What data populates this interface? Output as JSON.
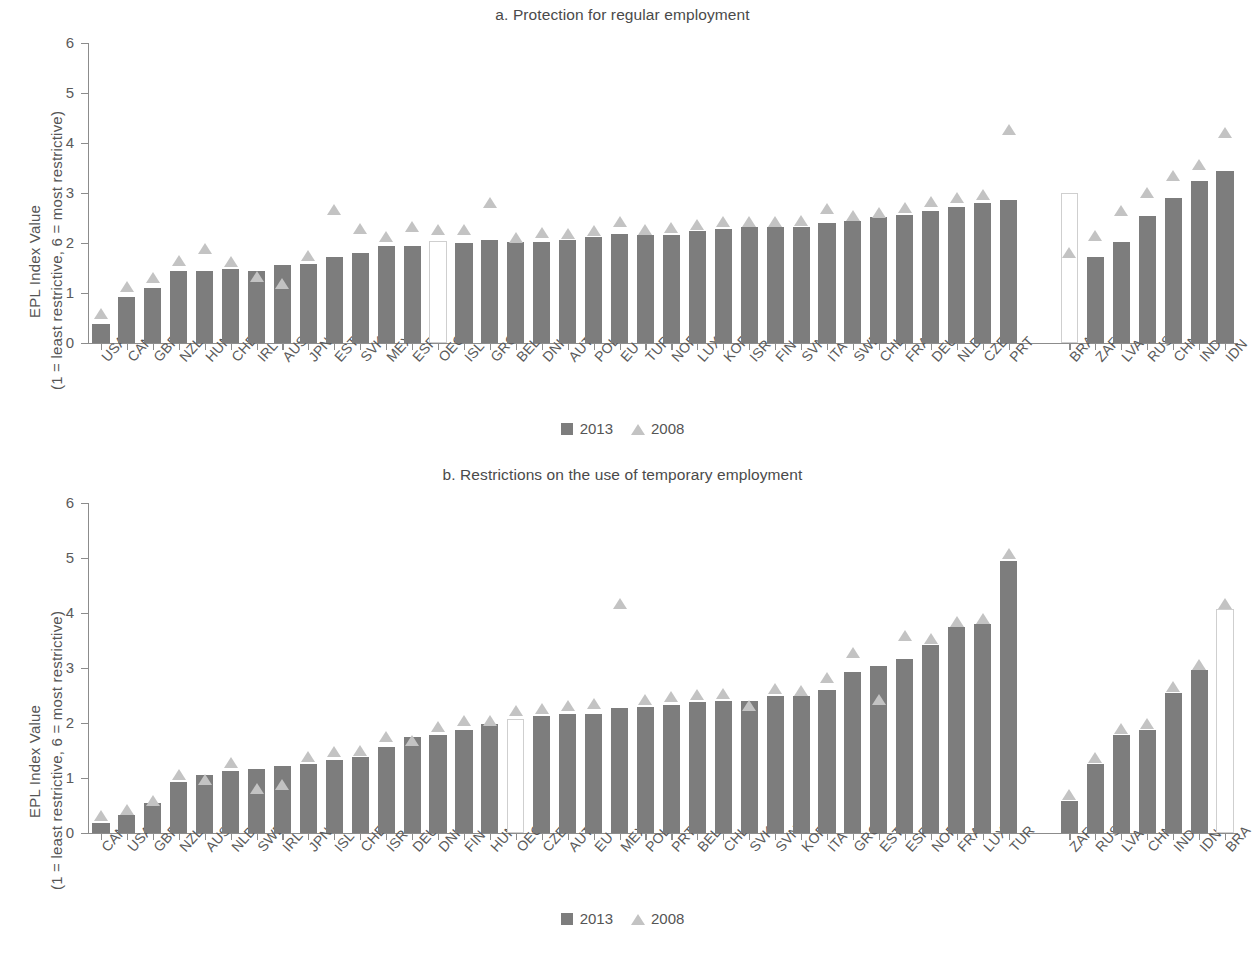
{
  "colors": {
    "bar_2013": "#7d7d7d",
    "marker_2008": "#c3c3c3",
    "hollow_bar_fill": "#ffffff",
    "axis": "#8c8c8c",
    "text": "#555555"
  },
  "legend": {
    "items": [
      {
        "label": "2013",
        "marker": "square"
      },
      {
        "label": "2008",
        "marker": "triangle"
      }
    ]
  },
  "axis_title": {
    "line1": "EPL Index Value",
    "line2": "(1 = least restrictive, 6 = most restrictive)"
  },
  "chart_data": [
    {
      "type": "bar",
      "panel": "a",
      "title": "a. Protection for regular employment",
      "xlabel": "",
      "ylabel": "EPL Index Value (1 = least restrictive, 6 = most restrictive)",
      "ylim": [
        0,
        6
      ],
      "yticks": [
        0,
        1,
        2,
        3,
        4,
        5,
        6
      ],
      "grid": false,
      "legend_position": "bottom-center",
      "highlight_categories": [
        "OECD",
        "BRA"
      ],
      "group_gap_after": "PRT",
      "categories": [
        "USA",
        "CAN",
        "GBR",
        "NZL",
        "HUN",
        "CHE",
        "IRL",
        "AUS",
        "JPN",
        "EST",
        "SVK",
        "MEX",
        "ESP",
        "OECD",
        "ISL",
        "GRC",
        "BEL",
        "DNK",
        "AUT",
        "POL",
        "EU",
        "TUR",
        "NOR",
        "LUX",
        "KOR",
        "ISR",
        "FIN",
        "SVN",
        "ITA",
        "SWE",
        "CHL",
        "FRA",
        "DEU",
        "NLD",
        "CZE",
        "PRT",
        "BRA",
        "ZAF",
        "LVA",
        "RUS",
        "CHN",
        "IND",
        "IDN"
      ],
      "series": [
        {
          "name": "2013",
          "marker": "bar",
          "values": [
            0.39,
            0.92,
            1.1,
            1.44,
            1.44,
            1.48,
            1.45,
            1.56,
            1.58,
            1.73,
            1.8,
            1.95,
            1.95,
            2.04,
            2.0,
            2.07,
            2.02,
            2.03,
            2.07,
            2.13,
            2.18,
            2.17,
            2.17,
            2.25,
            2.28,
            2.32,
            2.32,
            2.32,
            2.4,
            2.44,
            2.52,
            2.57,
            2.65,
            2.72,
            2.8,
            2.87,
            3.0,
            1.72,
            2.02,
            2.55,
            2.9,
            3.24,
            3.45,
            4.08
          ]
        },
        {
          "name": "2008",
          "marker": "triangle",
          "values": [
            0.48,
            1.02,
            1.2,
            1.54,
            1.79,
            1.52,
            1.23,
            1.09,
            1.64,
            2.56,
            2.18,
            2.03,
            2.22,
            2.17,
            2.17,
            2.7,
            2.01,
            2.11,
            2.08,
            2.14,
            2.32,
            2.17,
            2.2,
            2.26,
            2.33,
            2.32,
            2.33,
            2.35,
            2.58,
            2.45,
            2.51,
            2.6,
            2.72,
            2.8,
            2.87,
            4.17,
            1.7,
            2.05,
            2.55,
            2.91,
            3.25,
            3.46,
            4.11
          ]
        }
      ],
      "note_2013_length": 43
    },
    {
      "type": "bar",
      "panel": "b",
      "title": "b. Restrictions on the use of temporary employment",
      "xlabel": "",
      "ylabel": "EPL Index Value (1 = least restrictive, 6 = most restrictive)",
      "ylim": [
        0,
        6
      ],
      "yticks": [
        0,
        1,
        2,
        3,
        4,
        5,
        6
      ],
      "grid": false,
      "legend_position": "bottom-center",
      "highlight_categories": [
        "OECD",
        "BRA"
      ],
      "group_gap_after": "TUR",
      "categories": [
        "CAN",
        "USA",
        "GBR",
        "NZL",
        "AUS",
        "NLD",
        "SWE",
        "IRL",
        "JPN",
        "ISL",
        "CHE",
        "ISR",
        "DEU",
        "DNK",
        "FIN",
        "HUN",
        "OECD",
        "CZE",
        "AUT",
        "EU",
        "MEX",
        "POL",
        "PRT",
        "BEL",
        "CHL",
        "SVK",
        "SVN",
        "KOR",
        "ITA",
        "GRC",
        "EST",
        "ESP",
        "NOR",
        "FRA",
        "LUX",
        "TUR",
        "ZAF",
        "RUS",
        "LVA",
        "CHN",
        "IND",
        "IDN",
        "BRA"
      ],
      "series": [
        {
          "name": "2013",
          "marker": "bar",
          "values": [
            0.19,
            0.33,
            0.54,
            0.92,
            1.05,
            1.13,
            1.17,
            1.21,
            1.25,
            1.33,
            1.38,
            1.56,
            1.75,
            1.79,
            1.88,
            1.98,
            2.08,
            2.13,
            2.17,
            2.17,
            2.27,
            2.3,
            2.33,
            2.38,
            2.4,
            2.4,
            2.5,
            2.5,
            2.6,
            2.93,
            3.04,
            3.17,
            3.42,
            3.75,
            3.8,
            4.94,
            0.58,
            1.25,
            1.79,
            1.88,
            2.55,
            2.96,
            4.08
          ]
        },
        {
          "name": "2008",
          "marker": "triangle",
          "values": [
            0.21,
            0.33,
            0.5,
            0.96,
            0.88,
            1.19,
            0.71,
            0.79,
            1.3,
            1.38,
            1.4,
            1.65,
            1.58,
            1.83,
            1.94,
            1.94,
            2.13,
            2.17,
            2.22,
            2.25,
            4.08,
            2.33,
            2.38,
            2.42,
            2.44,
            2.22,
            2.53,
            2.5,
            2.73,
            3.19,
            2.33,
            3.5,
            3.44,
            3.75,
            3.8,
            4.99,
            0.6,
            1.27,
            1.8,
            1.9,
            2.57,
            2.97,
            4.08
          ]
        }
      ]
    }
  ]
}
